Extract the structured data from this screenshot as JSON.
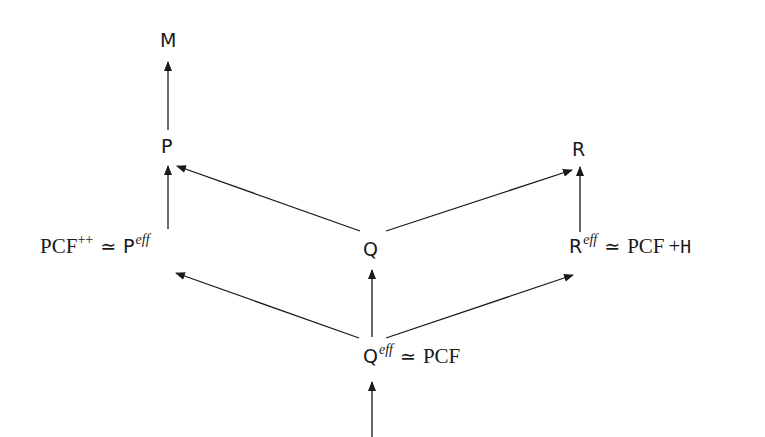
{
  "diagram": {
    "type": "commutative-diagram",
    "nodes": {
      "M": {
        "label": "M"
      },
      "P": {
        "label": "P"
      },
      "R": {
        "label": "R"
      },
      "Q": {
        "label": "Q"
      },
      "Peff": {
        "lhs": "PCF",
        "lhs_sup": "++",
        "rel": "≃",
        "base": "P",
        "sup": "eff"
      },
      "Reff": {
        "base": "R",
        "sup": "eff",
        "rel": "≃",
        "rhs": "PCF",
        "plus": "+",
        "rhs_extra": "H"
      },
      "Qeff": {
        "base": "Q",
        "sup": "eff",
        "rel": "≃",
        "rhs": "PCF"
      }
    },
    "edges": [
      {
        "from": "P",
        "to": "M"
      },
      {
        "from": "Peff",
        "to": "P"
      },
      {
        "from": "Q",
        "to": "P"
      },
      {
        "from": "Q",
        "to": "R"
      },
      {
        "from": "Reff",
        "to": "R"
      },
      {
        "from": "Qeff",
        "to": "Q"
      },
      {
        "from": "Qeff",
        "to": "Peff"
      },
      {
        "from": "Qeff",
        "to": "Reff"
      },
      {
        "from": "below",
        "to": "Qeff"
      }
    ],
    "colors": {
      "ink": "#1a1a1a",
      "background": "#ffffff"
    }
  }
}
